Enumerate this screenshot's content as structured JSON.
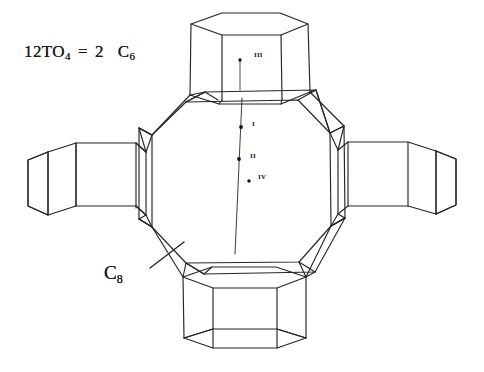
{
  "figure": {
    "caption_formula": {
      "prefix": "12TO",
      "sub1": "4",
      "equals": "=",
      "coefficient": "2",
      "species": "C",
      "sub2": "6"
    },
    "c8_label": {
      "species": "C",
      "subscript": "8"
    },
    "site_labels": [
      {
        "id": "III",
        "text": "III",
        "x": 250,
        "y": 57
      },
      {
        "id": "I",
        "text": "I",
        "x": 248,
        "y": 126
      },
      {
        "id": "II",
        "text": "II",
        "x": 246,
        "y": 158
      },
      {
        "id": "IV",
        "text": "IV",
        "x": 254,
        "y": 179
      }
    ],
    "site_dots": [
      {
        "id": "III",
        "x": 240,
        "y": 60
      },
      {
        "id": "I",
        "x": 241,
        "y": 127
      },
      {
        "id": "II",
        "x": 239,
        "y": 159
      },
      {
        "id": "IV",
        "x": 249,
        "y": 181
      }
    ],
    "axis_line": {
      "x1": 242,
      "y1": 98,
      "x2": 235,
      "y2": 254
    },
    "leader_line": {
      "x1": 150,
      "y1": 268,
      "x2": 184,
      "y2": 242
    },
    "colors": {
      "ink": "#1a1a1a",
      "line": "#262626",
      "background": "#ffffff"
    },
    "geometry": {
      "type": "wireframe-polyhedral-cluster",
      "core": {
        "shape": "octagonal-prism",
        "label": "C8",
        "center_x": 242,
        "center_y": 186
      },
      "arms": [
        {
          "position": "top",
          "shape": "hexagonal-prism",
          "label": "C6"
        },
        {
          "position": "bottom",
          "shape": "hexagonal-prism",
          "label": "C6"
        },
        {
          "position": "left",
          "shape": "hexagonal-prism",
          "label": "C6"
        },
        {
          "position": "right",
          "shape": "hexagonal-prism",
          "label": "C6"
        }
      ]
    }
  }
}
